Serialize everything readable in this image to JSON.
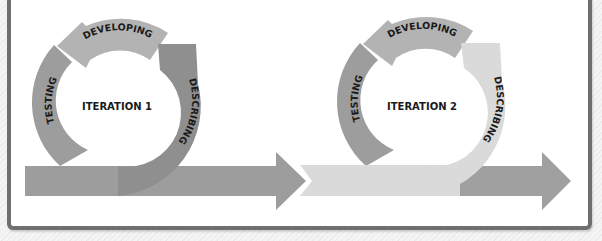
{
  "diagram": {
    "iterations": [
      {
        "label": "ITERATION 1",
        "phases": {
          "developing": "DEVELOPING",
          "describing": "DESCRIBING",
          "testing": "TESTING"
        },
        "colors": {
          "developing": "#b3b3b3",
          "describing": "#8f8f8f",
          "testing": "#9d9d9d",
          "timeline": "#9d9d9d"
        }
      },
      {
        "label": "ITERATION 2",
        "phases": {
          "developing": "DEVELOPING",
          "describing": "DESCRIBING",
          "testing": "TESTING"
        },
        "colors": {
          "developing": "#b3b3b3",
          "describing": "#dadada",
          "testing": "#9d9d9d",
          "timeline": "#dadada",
          "timeline_end": "#a0a0a0"
        }
      }
    ],
    "frame_border_color": "#6f6f6f"
  }
}
